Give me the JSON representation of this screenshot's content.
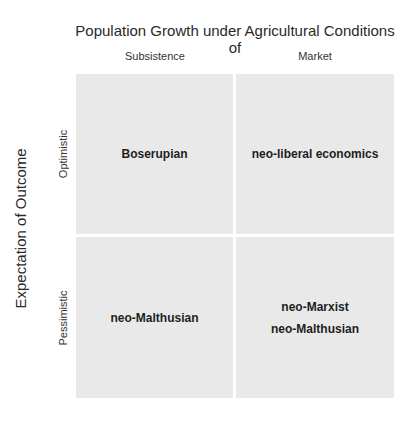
{
  "diagram": {
    "title": "Population Growth under Agricultural Conditions of",
    "columns": [
      "Subsistence",
      "Market"
    ],
    "y_axis_label": "Expectation of Outcome",
    "rows": [
      "Optimistic",
      "Pessimistic"
    ],
    "cells": {
      "optimistic_subsistence": "Boserupian",
      "optimistic_market": "neo-liberal economics",
      "pessimistic_subsistence": "neo-Malthusian",
      "pessimistic_market_line1": "neo-Marxist",
      "pessimistic_market_line2": "neo-Malthusian"
    },
    "colors": {
      "cell_fill": "#e9e9e9",
      "background": "#ffffff"
    }
  }
}
